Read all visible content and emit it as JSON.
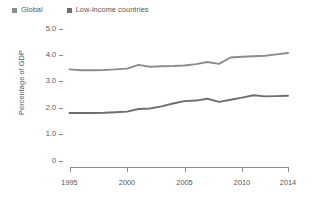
{
  "chart_data": {
    "type": "line",
    "title": "",
    "subtitle": "",
    "xlabel": "",
    "ylabel": "Percentage of GDP",
    "xlim": [
      1995,
      2014
    ],
    "ylim": [
      0,
      5.0
    ],
    "grid": false,
    "legend_position": "top-left",
    "x_tick_labels": [
      "1995",
      "2000",
      "2005",
      "2010",
      "2014"
    ],
    "x_ticks": [
      1995,
      2000,
      2005,
      2010,
      2014
    ],
    "y_tick_labels": [
      "5.0",
      "4.0",
      "3.0",
      "2.0",
      "1.0",
      "0"
    ],
    "y_ticks": [
      5.0,
      4.0,
      3.0,
      2.0,
      1.0,
      0
    ],
    "x": [
      1995,
      1996,
      1997,
      1998,
      1999,
      2000,
      2001,
      2002,
      2003,
      2004,
      2005,
      2006,
      2007,
      2008,
      2009,
      2010,
      2011,
      2012,
      2013,
      2014
    ],
    "series": [
      {
        "name": "Global",
        "color": "#8c8c8c",
        "values": [
          3.45,
          3.42,
          3.42,
          3.43,
          3.45,
          3.48,
          3.62,
          3.55,
          3.57,
          3.58,
          3.6,
          3.65,
          3.73,
          3.66,
          3.9,
          3.93,
          3.95,
          3.97,
          4.02,
          4.07
        ]
      },
      {
        "name": "Low-income countries",
        "color": "#6e6e6e",
        "values": [
          1.8,
          1.8,
          1.8,
          1.81,
          1.83,
          1.85,
          1.95,
          1.97,
          2.05,
          2.16,
          2.25,
          2.27,
          2.34,
          2.22,
          2.3,
          2.38,
          2.47,
          2.43,
          2.44,
          2.45
        ]
      }
    ]
  },
  "legend": {
    "entries": [
      {
        "label": "Global",
        "color": "#8c8c8c"
      },
      {
        "label": "Low-income countries",
        "color": "#6e6e6e"
      }
    ]
  },
  "axes": {
    "y_label": "Percentage of GDP",
    "y_tick_labels": [
      "5.0",
      "4.0",
      "3.0",
      "2.0",
      "1.0",
      "0"
    ],
    "x_tick_labels": [
      "1995",
      "2000",
      "2005",
      "2010",
      "2014"
    ]
  }
}
